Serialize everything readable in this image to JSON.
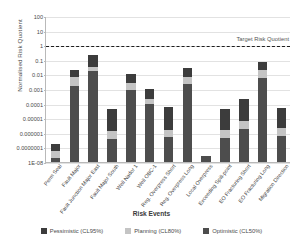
{
  "chart_data": {
    "type": "bar",
    "stacked": true,
    "title": "",
    "xlabel": "Risk Events",
    "ylabel": "Normalised Risk Quotient",
    "yscale": "log",
    "ylim": [
      1e-08,
      100
    ],
    "ytick_labels": [
      "100",
      "10",
      "1",
      "0.1",
      "0.01",
      "0.001",
      "0.0001",
      "0.00001",
      "0.000001",
      "0.0000001",
      "1E-08"
    ],
    "ytick_values": [
      100,
      10,
      1,
      0.1,
      0.01,
      0.001,
      0.0001,
      1e-05,
      1e-06,
      1e-07,
      1e-08
    ],
    "grid": true,
    "legend_position": "bottom",
    "annotations": [
      {
        "label": "Target Risk Quotient",
        "value": 1,
        "style": "dashed-horizontal-line"
      }
    ],
    "categories": [
      "Perm Seal",
      "Fault Major",
      "Fault Junction Major East",
      "Fault Major South",
      "Well Nador 1",
      "Well OBC-1",
      "Reg. Overpress Short",
      "Reg. Overpress Long",
      "Local Overpress",
      "Exceeding Spill-point",
      "EO Fracturing Short",
      "EO Fracturing Long",
      "Migration Direction"
    ],
    "series": [
      {
        "name": "Optimistic (CL50%)",
        "color": "#4d4d4d",
        "values": [
          2e-08,
          0.0016,
          0.017,
          4e-07,
          0.0008,
          9e-05,
          5e-07,
          0.0021,
          2.5e-08,
          4.5e-07,
          1.8e-06,
          0.006,
          6e-07
        ]
      },
      {
        "name": "Planning (CL80%)",
        "color": "#c4c4c4",
        "values": [
          6e-08,
          0.0064,
          0.033,
          1.3e-06,
          0.0026,
          0.00021,
          1.6e-06,
          0.0069,
          2.5e-08,
          1.5e-06,
          6e-06,
          0.02,
          2e-06
        ]
      },
      {
        "name": "Pessimistic (CL95%)",
        "color": "#3c3c3c",
        "values": [
          1.6e-07,
          0.021,
          0.2,
          4.5e-05,
          0.0105,
          0.00095,
          5.5e-05,
          0.027,
          2.5e-08,
          4.5e-05,
          0.00022,
          0.072,
          5e-05
        ]
      }
    ]
  },
  "legend": [
    {
      "label": "Pessimistic (CL95%)",
      "color": "#3c3c3c",
      "name": "legend-pessimistic"
    },
    {
      "label": "Planning (CL80%)",
      "color": "#c4c4c4",
      "name": "legend-planning"
    },
    {
      "label": "Optimistic (CL50%)",
      "color": "#4d4d4d",
      "name": "legend-optimistic"
    }
  ]
}
